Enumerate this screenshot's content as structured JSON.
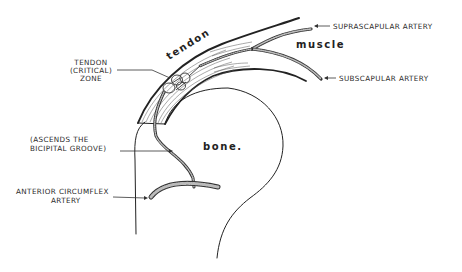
{
  "diagram": {
    "type": "anatomical illustration",
    "regions": {
      "tendon": "tendon",
      "muscle": "muscle",
      "bone": "bone."
    },
    "labels": {
      "critical_zone": [
        "TENDON",
        "(CRITICAL)",
        "ZONE"
      ],
      "suprascapular": "SUPRASCAPULAR ARTERY",
      "subscapular": "SUBSCAPULAR ARTERY",
      "bicipital": [
        "(ASCENDS THE",
        "BICIPITAL GROOVE)"
      ],
      "anterior_circumflex": [
        "ANTERIOR CIRCUMFLEX",
        "ARTERY"
      ]
    },
    "colors": {
      "ink": "#222222",
      "background": "#ffffff",
      "artery_fill": "#bbbbbb"
    }
  }
}
